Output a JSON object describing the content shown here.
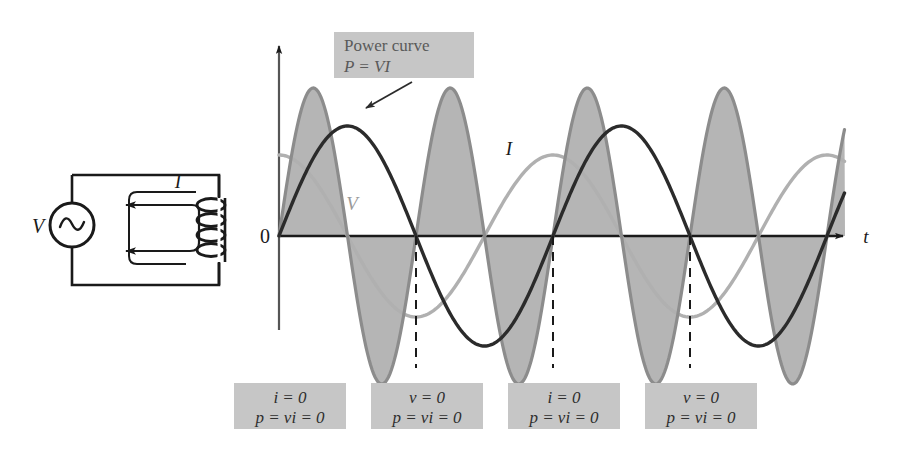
{
  "figure": {
    "title_hidden": "AC power in a purely inductive circuit",
    "axes": {
      "origin_label": "0",
      "x_axis_label": "t",
      "y_axis_label": ""
    },
    "curve_labels": {
      "voltage": "V",
      "current": "I",
      "power_line1": "Power curve",
      "power_line2": "P = VI"
    },
    "circuit": {
      "source_label": "V",
      "current_label": "I",
      "source_icon": "ac-source-sine-icon",
      "inductor_icon": "inductor-coil-icon",
      "coil_turns": 4
    },
    "annotations": [
      {
        "line1": "i = 0",
        "line2": "p = vi = 0",
        "x": 290,
        "y": 383
      },
      {
        "line1": "v = 0",
        "line2": "p = vi = 0",
        "x": 427,
        "y": 383
      },
      {
        "line1": "i = 0",
        "line2": "p = vi = 0",
        "x": 564,
        "y": 383
      },
      {
        "line1": "v = 0",
        "line2": "p = vi = 0",
        "x": 701,
        "y": 383
      }
    ],
    "colors": {
      "voltage_curve": "#b0b0b0",
      "current_curve": "#2b2b2b",
      "power_curve_stroke": "#8c8c8c",
      "power_fill": "#b5b5b5",
      "axis": "#1a1a1a",
      "label_box": "#c6c6c6",
      "label_text": "#5a5a5a",
      "circuit_line": "#1a1a1a"
    }
  },
  "chart_data": {
    "type": "line",
    "title": "Power curve P = VI",
    "xlabel": "t",
    "ylabel": "",
    "grid": false,
    "legend": "inline-curve-labels",
    "x_origin_px": 279,
    "baseline_px": 236,
    "period_px": 274,
    "axis_range_px": [
      279,
      845
    ],
    "series": [
      {
        "name": "V",
        "label": "V",
        "form": "cosine",
        "amplitude": 81,
        "phase_deg": 0,
        "frequency": 1,
        "color": "#b0b0b0",
        "description": "Voltage leads current by 90 degrees; starts at positive peak at t = 0"
      },
      {
        "name": "I",
        "label": "I",
        "form": "sine",
        "amplitude": 110,
        "phase_deg": 0,
        "frequency": 1,
        "color": "#2b2b2b",
        "description": "Current lags voltage by 90 degrees; starts at zero at t = 0"
      },
      {
        "name": "P",
        "label": "P = VI",
        "form": "sine",
        "amplitude": 148,
        "phase_deg": 0,
        "frequency": 2,
        "color": "#8c8c8c",
        "fill": "#b5b5b5",
        "description": "Power is product of v and i; oscillates at twice the frequency with zero average"
      }
    ],
    "zero_crossings_px": [
      279,
      416,
      553,
      690,
      827
    ],
    "annotation_points": [
      {
        "x_px": 279,
        "state": "i = 0",
        "power": "p = vi = 0"
      },
      {
        "x_px": 416,
        "state": "v = 0",
        "power": "p = vi = 0"
      },
      {
        "x_px": 553,
        "state": "i = 0",
        "power": "p = vi = 0"
      },
      {
        "x_px": 690,
        "state": "v = 0",
        "power": "p = vi = 0"
      }
    ]
  }
}
